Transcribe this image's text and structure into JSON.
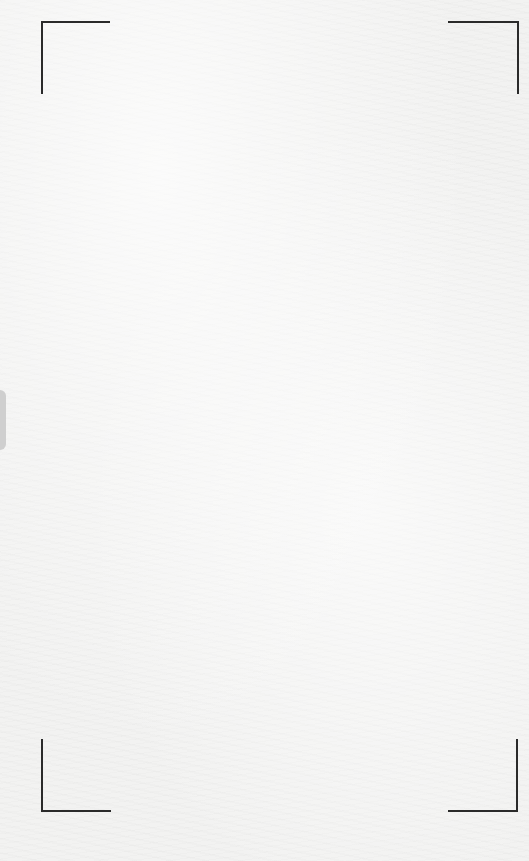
{
  "screen": {
    "type": "document-scanner-viewfinder",
    "background_color": "#f2f2f1",
    "frame_color": "#2a2a2a",
    "handle_color": "#cfcfcf"
  },
  "viewfinder": {
    "corners": [
      {
        "id": "top-left"
      },
      {
        "id": "top-right"
      },
      {
        "id": "bottom-left"
      },
      {
        "id": "bottom-right"
      }
    ]
  },
  "side_handle": {
    "position": "left"
  }
}
